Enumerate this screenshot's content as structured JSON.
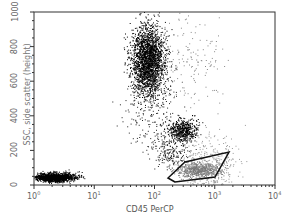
{
  "chart_data": {
    "type": "scatter",
    "title": "",
    "xlabel": "CD45 PerCP",
    "ylabel": "SSC, side scatter (height)",
    "xscale": "log",
    "xlim": [
      1,
      10000
    ],
    "ylim": [
      0,
      1000
    ],
    "x_ticks": [
      "10^0",
      "10^1",
      "10^2",
      "10^3",
      "10^4"
    ],
    "y_ticks": [
      "0",
      "200",
      "400",
      "600",
      "800",
      "1000"
    ],
    "populations": [
      {
        "name": "debris/low",
        "x_center": 3,
        "y_center": 30
      },
      {
        "name": "granulocytes",
        "x_center": 80,
        "y_center": 800
      },
      {
        "name": "monocytes",
        "x_center": 250,
        "y_center": 300
      },
      {
        "name": "lymphocytes (gated)",
        "x_center": 600,
        "y_center": 100
      }
    ],
    "gate": {
      "shape": "parallelogram",
      "vertices_xy": [
        [
          200,
          30
        ],
        [
          1500,
          140
        ],
        [
          1100,
          150
        ],
        [
          150,
          20
        ]
      ]
    },
    "grid": false,
    "legend": null
  },
  "axes": {
    "x_label": "CD45 PerCP",
    "y_label": "SSC, side scatter (height)",
    "x_ticks": [
      "0",
      "1",
      "2",
      "3",
      "4"
    ],
    "y_ticks": [
      "0",
      "200",
      "400",
      "600",
      "800",
      "1000"
    ]
  }
}
